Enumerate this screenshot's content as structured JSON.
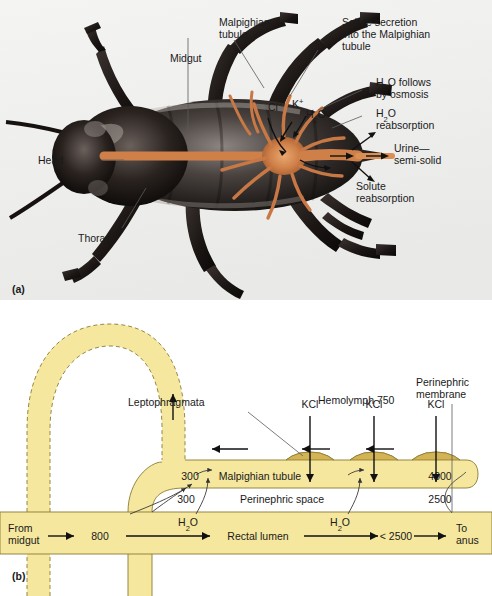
{
  "figure": {
    "panel_a_tag": "(a)",
    "panel_b_tag": "(b)"
  },
  "panel_a": {
    "title_hidden": "",
    "labels": {
      "midgut": "Midgut",
      "malpighian_tubule": "Malpighian\ntubule",
      "malpighian_tubule_l1": "Malpighian",
      "malpighian_tubule_l2": "tubule",
      "solute_secretion_l1": "Solute secretion",
      "solute_secretion_l2": "into the Malpighian",
      "solute_secretion_l3": "tubule",
      "h2o_osmosis_l1": "H",
      "h2o_osmosis_sub": "2",
      "h2o_osmosis_l1b": "O follows",
      "h2o_osmosis_l2": "by osmosis",
      "h2o_reabs_l1b": "O",
      "h2o_reabs_l2": "reabsorption",
      "urine_l1": "Urine—",
      "urine_l2": "semi-solid",
      "solute_reabs_l1": "Solute",
      "solute_reabs_l2": "reabsorption",
      "head": "Head",
      "thorax": "Thorax",
      "chloride": "Cl",
      "chloride_sup": "−",
      "potassium": "K",
      "potassium_sup": "+",
      "water": "H",
      "water_sub": "2",
      "water_b": "O"
    },
    "colors": {
      "body_dark": "#2a2320",
      "body_mid": "#6b6360",
      "tubule_orange": "#c87845",
      "gut_orange": "#d98f55",
      "background": "#f2f2f0"
    }
  },
  "panel_b": {
    "labels": {
      "leptophragmata": "Leptophragmata",
      "hemolymph": "Hemolymph 750",
      "perinephric_membrane_l1": "Perinephric",
      "perinephric_membrane_l2": "membrane",
      "kcl_1": "KCl",
      "kcl_2": "KCl",
      "kcl_3": "KCl",
      "malpighian_tubule": "Malpighian tubule",
      "perinephric_space": "Perinephric space",
      "rectal_lumen": "Rectal lumen",
      "from_midgut_l1": "From",
      "from_midgut_l2": "midgut",
      "to_anus_l1": "To",
      "to_anus_l2": "anus",
      "h2o_left_a": "H",
      "h2o_left_sub": "2",
      "h2o_left_b": "O",
      "h2o_right_a": "H",
      "h2o_right_sub": "2",
      "h2o_right_b": "O"
    },
    "values": {
      "tubule_left_osmolality": "300",
      "perinephric_left_osmolality": "300",
      "tubule_right_osmolality": "4000",
      "perinephric_right_osmolality": "2500",
      "rectum_inlet_osmolality": "800",
      "rectum_outlet_osmolality": "< 2500"
    },
    "colors": {
      "tubule_fill": "#f5e79e",
      "tubule_stroke": "#8a7a33",
      "leptophragma_fill": "#d4b355",
      "arrow": "#111111"
    }
  }
}
